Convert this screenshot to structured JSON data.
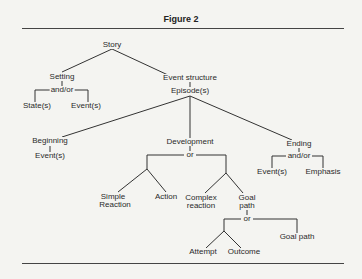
{
  "figure": {
    "title": "Figure 2"
  },
  "tree": {
    "root": "Story",
    "setting": {
      "label": "Setting",
      "connector": "and/or",
      "children": [
        "State(s)",
        "Event(s)"
      ]
    },
    "event_structure": {
      "label": "Event structure",
      "sub": "Episode(s)",
      "beginning": {
        "label": "Beginning",
        "child": "Event(s)"
      },
      "development": {
        "label": "Development",
        "connector": "or",
        "children": [
          "Simple",
          "Reaction",
          "Action",
          "Complex",
          "reaction",
          "Goal",
          "path"
        ],
        "goal_path": {
          "connector": "or",
          "children": [
            "Attempt",
            "Outcome",
            "Goal path"
          ]
        }
      },
      "ending": {
        "label": "Ending",
        "connector": "and/or",
        "children": [
          "Event(s)",
          "Emphasis"
        ]
      }
    }
  },
  "colors": {
    "background": "#f4f4f1",
    "ink": "#2a2a2a"
  }
}
